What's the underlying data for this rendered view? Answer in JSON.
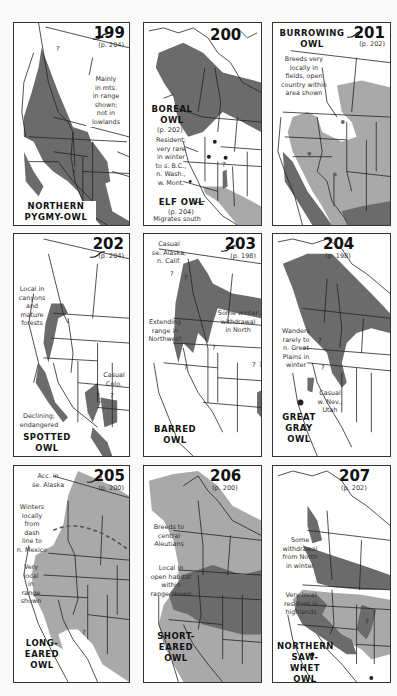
{
  "colors": {
    "dark_range": "#6b6b6b",
    "light_range": "#a9a9a9",
    "border": "#333333",
    "background": "#ffffff"
  },
  "maps": [
    {
      "number": "199",
      "page_ref": "(p. 204)",
      "species": [
        "NORTHERN",
        "PYGMY-OWL"
      ],
      "notes": [
        [
          "Mainly",
          "in mts.",
          "in range",
          "shown;",
          "not in",
          "lowlands"
        ]
      ],
      "question_marks": 2
    },
    {
      "number": "200",
      "species_boreal": [
        "BOREAL",
        "OWL"
      ],
      "page_ref_boreal": "(p. 202)",
      "notes_boreal": [
        "Resident;",
        "very rare",
        "in winter",
        "to s. B.C.,",
        "n. Wash.,",
        "w. Mont."
      ],
      "species_elf": "ELF OWL",
      "page_ref_elf": "(p. 204)",
      "notes_elf": [
        "Migrates south",
        "in winter"
      ],
      "question_marks": 1
    },
    {
      "number": "201",
      "page_ref": "(p. 202)",
      "species": [
        "BURROWING",
        "OWL"
      ],
      "notes": [
        "Breeds very",
        "locally in",
        "fields, open",
        "country within",
        "area shown"
      ]
    },
    {
      "number": "202",
      "page_ref": "(p. 204)",
      "species": [
        "SPOTTED",
        "OWL"
      ],
      "notes_top": [
        "Local in",
        "canyons",
        "and",
        "mature",
        "forests"
      ],
      "notes_right": [
        "Casual",
        "Colo."
      ],
      "notes_bottom": [
        "Declining;",
        "endangered"
      ],
      "question_marks": 2
    },
    {
      "number": "203",
      "page_ref": "(p. 198)",
      "species": [
        "BARRED",
        "OWL"
      ],
      "notes_top": [
        "Casual",
        "se. Alaska,",
        "n. Calif."
      ],
      "notes_left": [
        "Extending",
        "range in",
        "Northwest"
      ],
      "notes_right": [
        "Some winter",
        "withdrawal",
        "in North"
      ],
      "question_marks": 6
    },
    {
      "number": "204",
      "page_ref": "(p. 198)",
      "species": [
        "GREAT",
        "GRAY",
        "OWL"
      ],
      "notes_left": [
        "Wanders",
        "rarely to",
        "n. Great",
        "Plains in",
        "winter"
      ],
      "notes_bottom": [
        "Casual",
        "w. Nev.,",
        "Utah"
      ],
      "question_marks": 2
    },
    {
      "number": "205",
      "page_ref": "(p. 200)",
      "species": [
        "LONG-",
        "EARED",
        "OWL"
      ],
      "notes_top": [
        "Acc. in",
        "se. Alaska"
      ],
      "notes_mid": [
        "Winters",
        "locally",
        "from",
        "dash",
        "line to",
        "n. Mexico"
      ],
      "notes_low": [
        "Very",
        "local",
        "in",
        "range",
        "shown"
      ],
      "question_marks": 1
    },
    {
      "number": "206",
      "page_ref": "(p. 200)",
      "species": [
        "SHORT-",
        "EARED",
        "OWL"
      ],
      "notes_top": [
        "Breeds to",
        "central",
        "Aleutians"
      ],
      "notes_mid": [
        "Local in",
        "open habitat",
        "within",
        "range shown"
      ]
    },
    {
      "number": "207",
      "page_ref": "(p. 202)",
      "species": [
        "NORTHERN",
        "SAW-WHET",
        "OWL"
      ],
      "notes_top": [
        "Some",
        "withdrawal",
        "from North",
        "in winter"
      ],
      "notes_mid": [
        "Very local",
        "resident in",
        "highlands"
      ],
      "question_marks": 1
    }
  ]
}
